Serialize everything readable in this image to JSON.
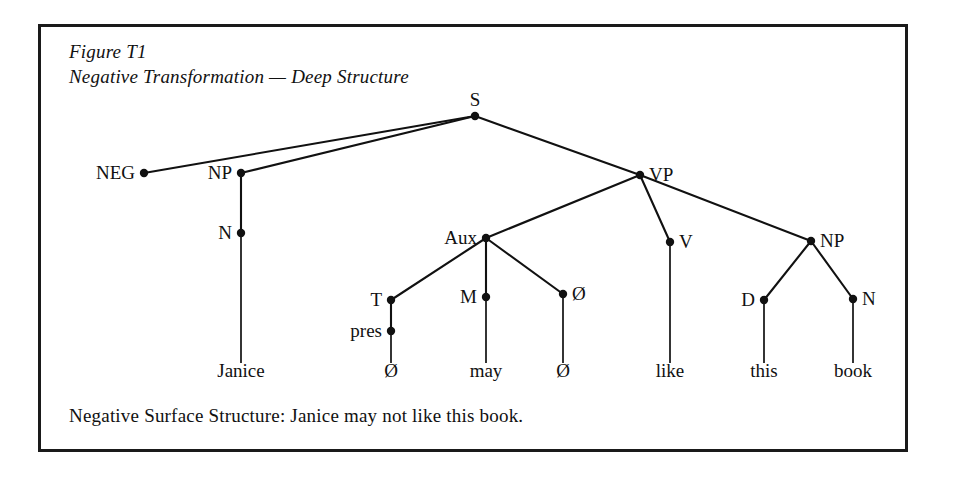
{
  "figure": {
    "label": "Figure T1",
    "title": "Negative Transformation — Deep Structure",
    "title_block": "Figure T1\nNegative Transformation — Deep Structure",
    "caption": "Negative Surface Structure:  Janice may not like this book.",
    "border_color": "#1a1a1a",
    "ink_color": "#111111"
  },
  "chart_data": {
    "type": "diagram",
    "subtype": "syntax-tree",
    "title": "Negative Transformation — Deep Structure",
    "sentence": "Janice may not like this book.",
    "nodes": [
      {
        "id": "S",
        "label": "S",
        "x": 434,
        "y": 89,
        "pos": "above"
      },
      {
        "id": "NEG",
        "label": "NEG",
        "x": 103,
        "y": 146,
        "pos": "left"
      },
      {
        "id": "NP1",
        "label": "NP",
        "x": 200,
        "y": 146,
        "pos": "left"
      },
      {
        "id": "VP",
        "label": "VP",
        "x": 599,
        "y": 148,
        "pos": "right"
      },
      {
        "id": "N1",
        "label": "N",
        "x": 200,
        "y": 206,
        "pos": "left"
      },
      {
        "id": "AUX",
        "label": "Aux",
        "x": 445,
        "y": 211,
        "pos": "left"
      },
      {
        "id": "V",
        "label": "V",
        "x": 629,
        "y": 215,
        "pos": "right"
      },
      {
        "id": "NP2",
        "label": "NP",
        "x": 770,
        "y": 214,
        "pos": "right"
      },
      {
        "id": "T",
        "label": "T",
        "x": 350,
        "y": 273,
        "pos": "left"
      },
      {
        "id": "M",
        "label": "M",
        "x": 445,
        "y": 270,
        "pos": "left"
      },
      {
        "id": "ZERO_A",
        "label": "Ø",
        "x": 522,
        "y": 267,
        "pos": "right"
      },
      {
        "id": "D",
        "label": "D",
        "x": 723,
        "y": 273,
        "pos": "left"
      },
      {
        "id": "N2",
        "label": "N",
        "x": 812,
        "y": 272,
        "pos": "right"
      },
      {
        "id": "PRES",
        "label": "pres",
        "x": 350,
        "y": 304,
        "pos": "left"
      }
    ],
    "edges": [
      {
        "from": "S",
        "to": "NEG"
      },
      {
        "from": "S",
        "to": "NP1"
      },
      {
        "from": "S",
        "to": "VP"
      },
      {
        "from": "NP1",
        "to": "N1"
      },
      {
        "from": "VP",
        "to": "AUX"
      },
      {
        "from": "VP",
        "to": "V"
      },
      {
        "from": "VP",
        "to": "NP2"
      },
      {
        "from": "AUX",
        "to": "T"
      },
      {
        "from": "AUX",
        "to": "M"
      },
      {
        "from": "AUX",
        "to": "ZERO_A"
      },
      {
        "from": "T",
        "to": "PRES"
      },
      {
        "from": "NP2",
        "to": "D"
      },
      {
        "from": "NP2",
        "to": "N2"
      }
    ],
    "terminals": [
      {
        "id": "t-janice",
        "label": "Janice",
        "x": 200,
        "y": 350,
        "from": "N1"
      },
      {
        "id": "t-zero-1",
        "label": "Ø",
        "x": 350,
        "y": 350,
        "from": "PRES"
      },
      {
        "id": "t-may",
        "label": "may",
        "x": 445,
        "y": 350,
        "from": "M"
      },
      {
        "id": "t-zero-2",
        "label": "Ø",
        "x": 522,
        "y": 350,
        "from": "ZERO_A"
      },
      {
        "id": "t-like",
        "label": "like",
        "x": 629,
        "y": 350,
        "from": "V"
      },
      {
        "id": "t-this",
        "label": "this",
        "x": 723,
        "y": 350,
        "from": "D"
      },
      {
        "id": "t-book",
        "label": "book",
        "x": 812,
        "y": 350,
        "from": "N2"
      }
    ]
  }
}
